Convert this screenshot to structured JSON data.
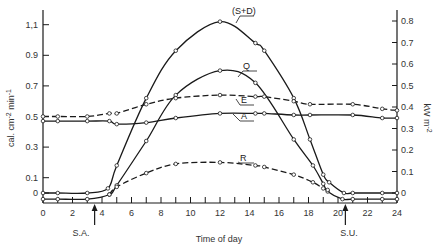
{
  "chart_data": {
    "type": "line",
    "title": "",
    "xlabel": "Time of day",
    "ylabel_left": "cal. cm-2 min-1",
    "ylabel_right": "kW m-2",
    "x_ticks": [
      0,
      2,
      4,
      6,
      8,
      10,
      12,
      14,
      16,
      18,
      20,
      22,
      24
    ],
    "x_tick_labels": [
      "0",
      "2",
      "4",
      "6",
      "8",
      "10",
      "12",
      "14",
      "16",
      "18",
      "20",
      "22",
      "24"
    ],
    "y_left_ticks": [
      0,
      0.1,
      0.3,
      0.5,
      0.7,
      0.9,
      1.1
    ],
    "y_left_tick_labels": [
      "0",
      "0.1",
      "0.3",
      "0.5",
      "0.7",
      "0.9",
      "1.1"
    ],
    "y_right_ticks": [
      0,
      0.1,
      0.2,
      0.3,
      0.4,
      0.5,
      0.6,
      0.7,
      0.8
    ],
    "y_right_tick_labels": [
      "0",
      "0.1",
      "0.2",
      "0.3",
      "0.4",
      "0.5",
      "0.6",
      "0.7",
      "0.8"
    ],
    "xlim": [
      0,
      24
    ],
    "ylim_left": [
      -0.07,
      1.22
    ],
    "ylim_right": [
      -0.05,
      0.87
    ],
    "grid": false,
    "annotations": [
      {
        "text": "S.A.",
        "x": 3.5,
        "meaning": "sunrise"
      },
      {
        "text": "S.U.",
        "x": 20.5,
        "meaning": "sunset"
      }
    ],
    "series": [
      {
        "name": "(S+D)",
        "style": "solid",
        "x": [
          0,
          1,
          3,
          4.4,
          5,
          7,
          9,
          12,
          14.4,
          15,
          17,
          18.1,
          19,
          19.4,
          20.4,
          21,
          23,
          24
        ],
        "values": [
          0.0,
          0.0,
          0.0,
          0.03,
          0.18,
          0.62,
          0.93,
          1.12,
          0.98,
          0.93,
          0.62,
          0.35,
          0.12,
          0.07,
          0.0,
          0.0,
          0.0,
          0.0
        ]
      },
      {
        "name": "Q",
        "style": "solid",
        "x": [
          0,
          1,
          3,
          4.5,
          5,
          7,
          9,
          12,
          14.4,
          17,
          18.3,
          19,
          19.3,
          20.3,
          21,
          23,
          24
        ],
        "values": [
          -0.04,
          -0.04,
          -0.04,
          -0.01,
          0.05,
          0.34,
          0.64,
          0.8,
          0.72,
          0.35,
          0.18,
          0.06,
          0.01,
          -0.04,
          -0.04,
          -0.04,
          -0.04
        ]
      },
      {
        "name": "E",
        "style": "dashed",
        "x": [
          0,
          1,
          3,
          4.5,
          5,
          7,
          9,
          12,
          14.4,
          15,
          17,
          18.1,
          21,
          23,
          24
        ],
        "values": [
          0.5,
          0.5,
          0.5,
          0.52,
          0.52,
          0.58,
          0.62,
          0.64,
          0.63,
          0.63,
          0.6,
          0.58,
          0.58,
          0.55,
          0.54
        ]
      },
      {
        "name": "A",
        "style": "solid",
        "x": [
          0,
          1,
          3,
          4.5,
          5,
          7,
          9,
          12,
          14.4,
          15,
          17,
          18.1,
          21,
          23,
          24
        ],
        "values": [
          0.47,
          0.47,
          0.47,
          0.47,
          0.45,
          0.46,
          0.49,
          0.52,
          0.52,
          0.52,
          0.51,
          0.51,
          0.51,
          0.49,
          0.49
        ]
      },
      {
        "name": "R",
        "style": "dashed",
        "x": [
          4.5,
          5,
          7,
          9,
          12,
          14.4,
          15,
          17,
          18.3,
          19,
          19.3
        ],
        "values": [
          -0.01,
          0.04,
          0.13,
          0.19,
          0.2,
          0.18,
          0.17,
          0.12,
          0.07,
          0.03,
          0.02
        ]
      }
    ]
  },
  "labels": {
    "xlabel": "Time of day",
    "sa": "S.A.",
    "su": "S.U.",
    "series_sd": "(S+D)",
    "series_q": "Q",
    "series_e": "E",
    "series_a": "A",
    "series_r": "R"
  }
}
